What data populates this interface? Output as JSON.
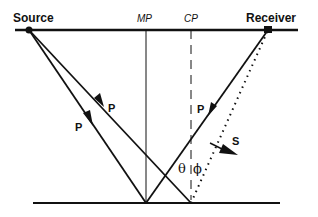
{
  "diagram": {
    "labels": {
      "source": "Source",
      "receiver": "Receiver",
      "midpoint": "MP",
      "conversion_point": "CP",
      "p_down_1": "P",
      "p_down_2": "P",
      "p_up": "P",
      "s_up": "S",
      "theta": "θ",
      "phi": "ϕ"
    },
    "colors": {
      "ink": "#111111",
      "background": "#ffffff"
    }
  }
}
